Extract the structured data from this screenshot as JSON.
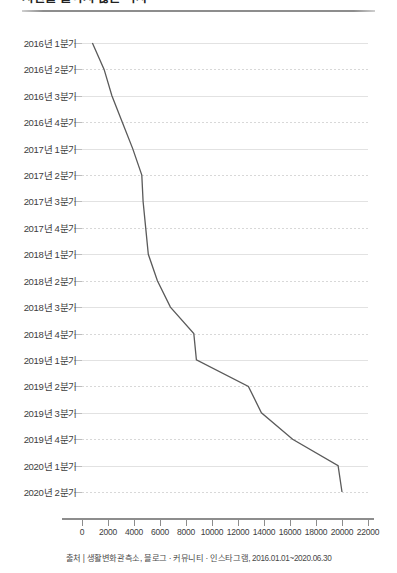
{
  "header": {
    "title_partial": "시간을 들이지 않는 식사",
    "divider_color": "#8d8d8d"
  },
  "source": {
    "text": "출처 | 생활변화관측소, 블로그 · 커뮤니티 · 인스타그램, 2016.01.01~2020.06.30"
  },
  "chart_data": {
    "type": "line",
    "orientation": "horizontal",
    "title": "시간을 들이지 않는 식사",
    "xlabel": "",
    "ylabel": "",
    "xlim": [
      0,
      22000
    ],
    "ylim": null,
    "grid": true,
    "legend": null,
    "line_color": "#5a5a5a",
    "xticks": [
      0,
      2000,
      4000,
      6000,
      8000,
      10000,
      12000,
      14000,
      16000,
      18000,
      20000,
      22000
    ],
    "xtick_labels": [
      "0",
      "2000",
      "4000",
      "6000",
      "8000",
      "10000",
      "12000",
      "14000",
      "16000",
      "18000",
      "20000",
      "22000"
    ],
    "categories": [
      "2016년 1분기",
      "2016년 2분기",
      "2016년 3분기",
      "2016년 4분기",
      "2017년 1분기",
      "2017년 2분기",
      "2017년 3분기",
      "2017년 4분기",
      "2018년 1분기",
      "2018년 2분기",
      "2018년 3분기",
      "2018년 4분기",
      "2019년 1분기",
      "2019년 2분기",
      "2019년 3분기",
      "2019년 4분기",
      "2020년 1분기",
      "2020년 2분기"
    ],
    "values": [
      800,
      1700,
      2300,
      3100,
      3900,
      4600,
      4700,
      4900,
      5100,
      5800,
      6800,
      8600,
      8800,
      12800,
      13800,
      16200,
      19700,
      20000
    ]
  }
}
